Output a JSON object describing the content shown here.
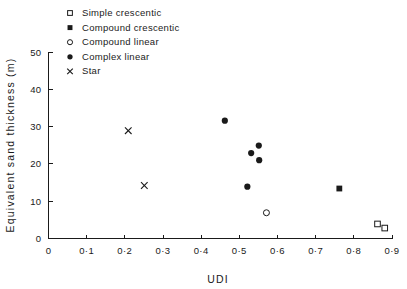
{
  "chart_data": {
    "type": "scatter",
    "title": "",
    "xlabel": "UDI",
    "ylabel": "Equivalent sand thickness (m)",
    "xlim": [
      0,
      0.9
    ],
    "ylim": [
      0,
      50
    ],
    "grid": false,
    "legend_position": "top-left-inside",
    "xticks": [
      0,
      0.1,
      0.2,
      0.3,
      0.4,
      0.5,
      0.6,
      0.7,
      0.8,
      0.9
    ],
    "xticklabels": [
      "0",
      "0·1",
      "0·2",
      "0·3",
      "0·4",
      "0·5",
      "0·6",
      "0·7",
      "0·8",
      "0·9"
    ],
    "yticks": [
      0,
      10,
      20,
      30,
      40,
      50
    ],
    "yticklabels": [
      "0",
      "10",
      "20",
      "30",
      "40",
      "50"
    ],
    "series": [
      {
        "name": "Simple   crescentic",
        "marker": "open-square",
        "points": [
          {
            "x": 0.862,
            "y": 3.9
          },
          {
            "x": 0.881,
            "y": 2.8
          }
        ]
      },
      {
        "name": "Compound   crescentic",
        "marker": "filled-square",
        "points": [
          {
            "x": 0.762,
            "y": 13.4
          }
        ]
      },
      {
        "name": "Compound   linear",
        "marker": "open-circle",
        "points": [
          {
            "x": 0.571,
            "y": 6.9
          }
        ]
      },
      {
        "name": "Complex   linear",
        "marker": "filled-circle",
        "points": [
          {
            "x": 0.462,
            "y": 31.6
          },
          {
            "x": 0.551,
            "y": 24.9
          },
          {
            "x": 0.531,
            "y": 22.9
          },
          {
            "x": 0.552,
            "y": 21.0
          },
          {
            "x": 0.521,
            "y": 13.9
          }
        ]
      },
      {
        "name": "Star",
        "marker": "cross",
        "points": [
          {
            "x": 0.209,
            "y": 28.9
          },
          {
            "x": 0.251,
            "y": 14.2
          }
        ]
      }
    ]
  },
  "legend": {
    "entries": [
      {
        "label": "Simple   crescentic",
        "marker": "open-square"
      },
      {
        "label": "Compound   crescentic",
        "marker": "filled-square"
      },
      {
        "label": "Compound   linear",
        "marker": "open-circle"
      },
      {
        "label": "Complex   linear",
        "marker": "filled-circle"
      },
      {
        "label": "Star",
        "marker": "cross"
      }
    ]
  },
  "colors": {
    "ink": "#1a1a1a",
    "background": "#ffffff"
  }
}
